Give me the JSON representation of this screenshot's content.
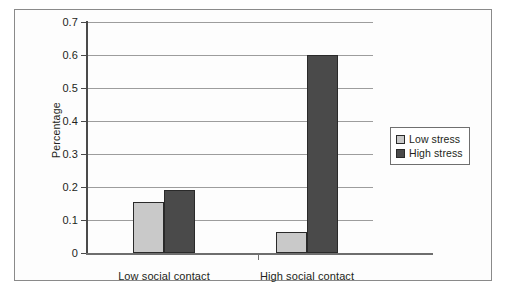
{
  "chart_data": {
    "type": "bar",
    "title": "",
    "subtitle": "",
    "xlabel": "",
    "ylabel": "Percentage",
    "categories": [
      "Low social contact",
      "High social contact"
    ],
    "series": [
      {
        "name": "Low stress",
        "values": [
          0.155,
          0.065
        ],
        "color": "#c9c9c9"
      },
      {
        "name": "High stress",
        "values": [
          0.19,
          0.6
        ],
        "color": "#4a4a4a"
      }
    ],
    "ylim": [
      0,
      0.7
    ],
    "ytick_values": [
      0,
      0.1,
      0.2,
      0.3,
      0.4,
      0.5,
      0.6,
      0.7
    ],
    "ytick_labels": [
      "0",
      "0.1",
      "0.2",
      "0.3",
      "0.4",
      "0.5",
      "0.6",
      "0.7"
    ],
    "grid": true,
    "grid_axis": "y",
    "legend_position": "right"
  },
  "legend": {
    "entries": [
      {
        "label": "Low stress"
      },
      {
        "label": "High stress"
      }
    ]
  },
  "axes": {
    "y_title": "Percentage",
    "y_labels": [
      "0.7",
      "0.6",
      "0.5",
      "0.4",
      "0.3",
      "0.2",
      "0.1",
      "0"
    ],
    "x_labels": [
      "Low social contact",
      "High social contact"
    ]
  },
  "colors": {
    "low_stress": "#c9c9c9",
    "high_stress": "#4a4a4a",
    "gridline": "#9d9d9d",
    "axis": "#4a4a4a",
    "frame": "#8a8a8a",
    "text": "#231f20"
  }
}
